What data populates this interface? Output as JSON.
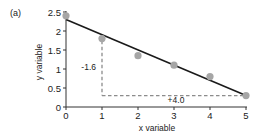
{
  "panel_label": "(a)",
  "chart_data": {
    "type": "scatter",
    "title": "",
    "panel": "(a)",
    "xlabel": "x variable",
    "ylabel": "y variable",
    "xlim": [
      0,
      5
    ],
    "ylim": [
      0,
      2.5
    ],
    "grid": false,
    "legend": null,
    "x_ticks": [
      0,
      1,
      2,
      3,
      4,
      5
    ],
    "x_tick_labels": [
      "0",
      "1",
      "2",
      "3",
      "4",
      "5"
    ],
    "y_ticks": [
      0,
      0.5,
      1,
      1.5,
      2,
      2.5
    ],
    "y_tick_labels": [
      "0",
      "0.5",
      "1",
      "1.5",
      "2",
      "2.5"
    ],
    "series": [
      {
        "name": "observations",
        "kind": "scatter",
        "color": "#a6a6a6",
        "x": [
          0,
          1,
          2,
          3,
          4,
          5
        ],
        "y": [
          2.4,
          1.8,
          1.35,
          1.1,
          0.8,
          0.3
        ]
      },
      {
        "name": "regression line",
        "kind": "line",
        "color": "#1a1a1a",
        "x": [
          0,
          5
        ],
        "y": [
          2.3,
          0.3
        ]
      }
    ],
    "annotations": [
      {
        "text": "-1.6",
        "type": "rise",
        "from": [
          1,
          1.9
        ],
        "to": [
          1,
          0.3
        ]
      },
      {
        "text": "+4.0",
        "type": "run",
        "from": [
          1,
          0.3
        ],
        "to": [
          5,
          0.3
        ]
      }
    ]
  },
  "annotations": {
    "rise_label": "-1.6",
    "run_label": "+4.0"
  }
}
